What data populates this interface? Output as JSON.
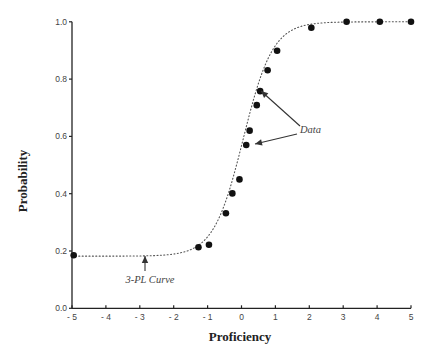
{
  "chart_data": {
    "type": "scatter",
    "title": "",
    "xlabel": "Proficiency",
    "ylabel": "Probability",
    "xlim": [
      -5,
      5
    ],
    "ylim": [
      0.0,
      1.0
    ],
    "x_ticks": [
      -5,
      -4,
      -3,
      -2,
      -1,
      0,
      1,
      2,
      3,
      4,
      5
    ],
    "x_tick_labels": [
      "- 5",
      "- 4",
      "- 3",
      "- 2",
      "- 1",
      "0",
      "1",
      "2",
      "3",
      "4",
      "5"
    ],
    "y_ticks": [
      0.0,
      0.2,
      0.4,
      0.6,
      0.8,
      1.0
    ],
    "y_tick_labels": [
      "0.0",
      "0.2",
      "0.4",
      "0.6",
      "0.8",
      "1.0"
    ],
    "grid": false,
    "legend": null,
    "series": [
      {
        "name": "Data",
        "kind": "points",
        "x": [
          -4.95,
          -1.27,
          -0.96,
          -0.46,
          -0.27,
          -0.06,
          0.14,
          0.24,
          0.45,
          0.55,
          0.77,
          1.05,
          2.06,
          3.1,
          4.08,
          5.0
        ],
        "y": [
          0.185,
          0.213,
          0.222,
          0.332,
          0.401,
          0.45,
          0.57,
          0.62,
          0.709,
          0.758,
          0.831,
          0.899,
          0.979,
          1.0,
          1.0,
          1.0
        ]
      },
      {
        "name": "3-PL Curve",
        "kind": "dotted-curve",
        "model": "3PL",
        "params": {
          "a": 1.35,
          "b": 0.05,
          "c": 0.182,
          "D": 1.7
        }
      }
    ],
    "annotations": [
      {
        "text": "Data",
        "x": 1.8,
        "y": 0.62,
        "arrows_to": [
          [
            0.62,
            0.75
          ],
          [
            0.42,
            0.57
          ]
        ]
      },
      {
        "text": "3-PL Curve",
        "x": -2.7,
        "y": 0.1,
        "arrows_to": [
          [
            -2.85,
            0.18
          ]
        ]
      }
    ]
  },
  "labels": {
    "xlabel": "Proficiency",
    "ylabel": "Probability",
    "data_annotation": "Data",
    "curve_annotation": "3-PL Curve"
  }
}
